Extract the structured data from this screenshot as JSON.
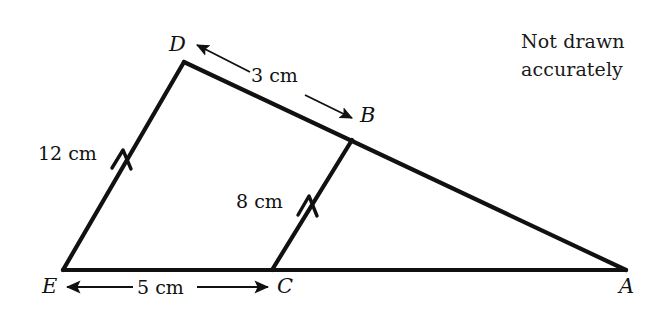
{
  "canvas": {
    "width": 669,
    "height": 319,
    "background": "#ffffff",
    "stroke_color": "#111111"
  },
  "note": {
    "line1": "Not drawn",
    "line2": "accurately"
  },
  "vertices": {
    "A": {
      "label": "A",
      "x": 626,
      "y": 270
    },
    "B": {
      "label": "B",
      "x": 352,
      "y": 140
    },
    "C": {
      "label": "C",
      "x": 272,
      "y": 270
    },
    "D": {
      "label": "D",
      "x": 184,
      "y": 62
    },
    "E": {
      "label": "E",
      "x": 63,
      "y": 270
    }
  },
  "dimensions": {
    "DB": {
      "label": "3 cm",
      "value": 3,
      "unit": "cm",
      "from": "D",
      "to": "B",
      "arrow": "double"
    },
    "ED": {
      "label": "12 cm",
      "value": 12,
      "unit": "cm",
      "side": "E-D",
      "arrow": "parallel-mark"
    },
    "CB": {
      "label": "8 cm",
      "value": 8,
      "unit": "cm",
      "side": "C-B",
      "arrow": "parallel-mark"
    },
    "EC": {
      "label": "5 cm",
      "value": 5,
      "unit": "cm",
      "from": "E",
      "to": "C",
      "arrow": "double"
    }
  },
  "segments": [
    {
      "name": "side-ED",
      "from": "E",
      "to": "D",
      "weight": "thick"
    },
    {
      "name": "side-DA",
      "from": "D",
      "to": "A",
      "weight": "thick"
    },
    {
      "name": "side-EA",
      "from": "E",
      "to": "A",
      "weight": "thick"
    },
    {
      "name": "segment-CB",
      "from": "C",
      "to": "B",
      "weight": "thick"
    }
  ]
}
